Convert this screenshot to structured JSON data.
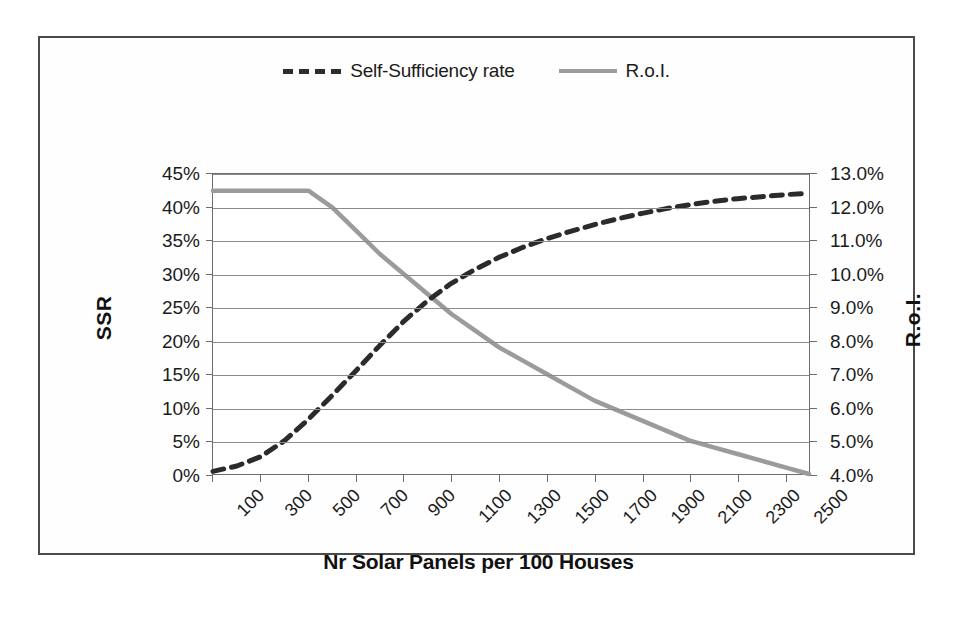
{
  "legend": {
    "position": "top-center",
    "entries": [
      {
        "label": "Self-Sufficiency rate",
        "style": "dashed",
        "color": "#2b2b2b",
        "icon": "dashed-line-icon"
      },
      {
        "label": "R.o.I.",
        "style": "solid",
        "color": "#9b9b9b",
        "icon": "solid-line-icon"
      }
    ]
  },
  "axes": {
    "y_left": {
      "title": "SSR",
      "ticks": [
        "0%",
        "5%",
        "10%",
        "15%",
        "20%",
        "25%",
        "30%",
        "35%",
        "40%",
        "45%"
      ],
      "min": 0,
      "max": 45
    },
    "y_right": {
      "title": "R.o.I.",
      "ticks": [
        "4.0%",
        "5.0%",
        "6.0%",
        "7.0%",
        "8.0%",
        "9.0%",
        "10.0%",
        "11.0%",
        "12.0%",
        "13.0%"
      ],
      "min": 4,
      "max": 13
    },
    "x": {
      "title": "Nr Solar Panels per 100 Houses",
      "ticks": [
        "100",
        "300",
        "500",
        "700",
        "900",
        "1100",
        "1300",
        "1500",
        "1700",
        "1900",
        "2100",
        "2300",
        "2500"
      ],
      "min": 100,
      "max": 2600
    }
  },
  "chart_data": {
    "type": "line",
    "title": "",
    "xlabel": "Nr Solar Panels per 100 Houses",
    "ylabel": "SSR",
    "y2label": "R.o.I.",
    "xlim": [
      100,
      2600
    ],
    "ylim": [
      0,
      45
    ],
    "y2lim": [
      4,
      13
    ],
    "grid": true,
    "legend_position": "top-center",
    "x": [
      100,
      200,
      300,
      400,
      500,
      600,
      700,
      800,
      900,
      1000,
      1100,
      1200,
      1300,
      1400,
      1500,
      1600,
      1700,
      1800,
      1900,
      2000,
      2100,
      2200,
      2300,
      2400,
      2500,
      2600
    ],
    "series": [
      {
        "name": "Self-Sufficiency rate",
        "axis": "left",
        "units": "%",
        "style": "dashed",
        "color": "#2b2b2b",
        "values": [
          0.4,
          1.2,
          2.6,
          5.0,
          8.2,
          11.8,
          15.5,
          19.3,
          22.9,
          26.0,
          28.6,
          30.7,
          32.5,
          34.0,
          35.3,
          36.4,
          37.4,
          38.3,
          39.1,
          39.8,
          40.4,
          40.9,
          41.3,
          41.6,
          41.9,
          42.1
        ]
      },
      {
        "name": "R.o.I.",
        "axis": "right",
        "units": "%",
        "style": "solid",
        "color": "#9b9b9b",
        "values": [
          12.5,
          12.5,
          12.5,
          12.5,
          12.5,
          12.0,
          11.3,
          10.6,
          10.0,
          9.4,
          8.8,
          8.3,
          7.8,
          7.4,
          7.0,
          6.6,
          6.2,
          5.9,
          5.6,
          5.3,
          5.0,
          4.8,
          4.6,
          4.4,
          4.2,
          4.0
        ]
      }
    ]
  }
}
